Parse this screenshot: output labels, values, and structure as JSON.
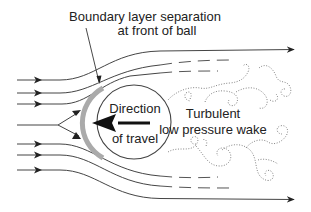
{
  "diagram": {
    "labels": {
      "separation_line1": "Boundary layer separation",
      "separation_line2": "at front of ball",
      "ball_line1": "Direction",
      "ball_line2": "of travel",
      "wake_line1": "Turbulent",
      "wake_line2": "low pressure wake"
    },
    "elements": {
      "ball": {
        "shape": "circle",
        "fill": "#ffffff",
        "stroke": "#444444",
        "boundary_layer_color": "#aaaaaa"
      },
      "direction_arrow": {
        "direction": "left",
        "color": "#111111"
      },
      "incoming_streamlines": 7,
      "outgoing_streamlines_top": 3,
      "outgoing_streamlines_bottom": 3,
      "wake_style": "dotted swirls"
    },
    "colors": {
      "background": "#ffffff",
      "line": "#444444",
      "text": "#222222",
      "boundary_layer": "#aaaaaa",
      "wake": "#777777"
    }
  }
}
